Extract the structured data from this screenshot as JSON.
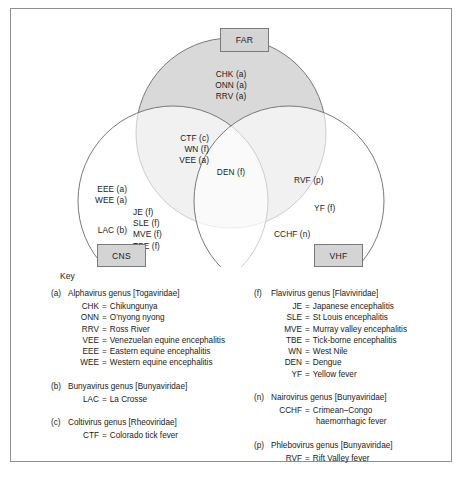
{
  "figure": {
    "sets": [
      {
        "id": "far",
        "label": "FAR"
      },
      {
        "id": "cns",
        "label": "CNS"
      },
      {
        "id": "vhf",
        "label": "VHF"
      }
    ],
    "regions": {
      "far_only": [
        "CHK (a)",
        "ONN (a)",
        "RRV (a)"
      ],
      "far_cns": [
        "CTF (c)",
        "WN (f)",
        "VEE (a)"
      ],
      "far_vhf": [
        "DEN (f)"
      ],
      "cns_only_upper": [
        "EEE (a)",
        "WEE (a)"
      ],
      "cns_only_lac": [
        "LAC (b)"
      ],
      "cns_only_flavi": [
        "JE (f)",
        "SLE (f)",
        "MVE (f)",
        "TBE (f)"
      ],
      "vhf_only_rvf": [
        "RVF (p)"
      ],
      "vhf_only_yf": [
        "YF (f)"
      ],
      "vhf_only_cchf": [
        "CCHF (n)"
      ]
    },
    "colors": {
      "far_fill": "#d9d9d9",
      "box_fill": "#d4d4d4",
      "outline": "#77797d",
      "frame": "#8d9095"
    }
  },
  "key": {
    "title": "Key",
    "groups": [
      {
        "marker": "(a)",
        "genus": "Alphavirus genus [Togaviridae]",
        "column": "left",
        "entries": [
          {
            "abbr": "CHK",
            "eq": "=",
            "name": "Chikungunya"
          },
          {
            "abbr": "ONN",
            "eq": "=",
            "name": "O'nyong nyong"
          },
          {
            "abbr": "RRV",
            "eq": "=",
            "name": "Ross River"
          },
          {
            "abbr": "VEE",
            "eq": "=",
            "name": "Venezuelan equine encephalitis"
          },
          {
            "abbr": "EEE",
            "eq": "=",
            "name": "Eastern equine encephalitis"
          },
          {
            "abbr": "WEE",
            "eq": "=",
            "name": "Western equine encephalitis"
          }
        ]
      },
      {
        "marker": "(b)",
        "genus": "Bunyavirus genus [Bunyaviridae]",
        "column": "left",
        "entries": [
          {
            "abbr": "LAC",
            "eq": "=",
            "name": "La Crosse"
          }
        ]
      },
      {
        "marker": "(c)",
        "genus": "Coltivirus genus [Rheoviridae]",
        "column": "left",
        "entries": [
          {
            "abbr": "CTF",
            "eq": "=",
            "name": "Colorado tick fever"
          }
        ]
      },
      {
        "marker": "(f)",
        "genus": "Flavivirus genus [Flaviviridae]",
        "column": "right",
        "entries": [
          {
            "abbr": "JE",
            "eq": "=",
            "name": "Japanese encephalitis"
          },
          {
            "abbr": "SLE",
            "eq": "=",
            "name": "St Louis encephalitis"
          },
          {
            "abbr": "MVE",
            "eq": "=",
            "name": "Murray valley encephalitis"
          },
          {
            "abbr": "TBE",
            "eq": "=",
            "name": "Tick-borne encephalitis"
          },
          {
            "abbr": "WN",
            "eq": "=",
            "name": "West Nile"
          },
          {
            "abbr": "DEN",
            "eq": "=",
            "name": "Dengue"
          },
          {
            "abbr": "YF",
            "eq": "=",
            "name": "Yellow fever"
          }
        ]
      },
      {
        "marker": "(n)",
        "genus": "Nairovirus genus [Bunyaviridae]",
        "column": "right",
        "entries": [
          {
            "abbr": "CCHF",
            "eq": "=",
            "name": "Crimean–Congo",
            "cont": "haemorrhagic fever"
          }
        ]
      },
      {
        "marker": "(p)",
        "genus": "Phlebovirus genus [Bunyaviridae]",
        "column": "right",
        "entries": [
          {
            "abbr": "RVF",
            "eq": "=",
            "name": "Rift Valley fever"
          }
        ]
      }
    ]
  }
}
